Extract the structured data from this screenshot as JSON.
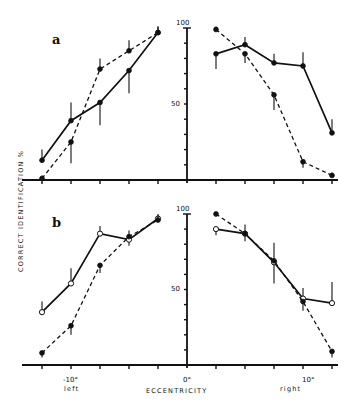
{
  "figure": {
    "y_axis_label": "CORRECT IDENTIFICATION %",
    "x_axis_label": "ECCENTRICITY",
    "x_tick_labels": {
      "left10": "-10°",
      "zero": "0°",
      "right10": "10°"
    },
    "side_labels": {
      "left": "left",
      "right": "right"
    },
    "y_tick_labels": {
      "top": "100",
      "mid": "50"
    },
    "panel_labels": [
      "a",
      "b"
    ]
  },
  "chart_data": [
    {
      "type": "line",
      "title": "a",
      "xlabel": "ECCENTRICITY",
      "ylabel": "CORRECT IDENTIFICATION %",
      "ylim": [
        0,
        100
      ],
      "x_left": [
        -12.5,
        -10,
        -7.5,
        -5,
        -2.5
      ],
      "x_right": [
        2.5,
        5,
        7.5,
        10,
        12.5
      ],
      "grid": false,
      "series": [
        {
          "name": "solid (filled circles)",
          "style": "solid",
          "marker": "filled",
          "left": [
            13,
            39,
            51,
            72,
            97
          ],
          "right": [
            83,
            89,
            77,
            75,
            31
          ],
          "err_left": [
            7,
            12,
            -15,
            -15,
            4
          ],
          "err_right": [
            -10,
            5,
            6,
            9,
            9
          ]
        },
        {
          "name": "dashed (filled circles)",
          "style": "dashed",
          "marker": "filled",
          "left": [
            1,
            25,
            73,
            85,
            97
          ],
          "right": [
            99,
            83,
            56,
            12,
            3
          ],
          "err_left": [
            2,
            -14,
            7,
            7,
            4
          ],
          "err_right": [
            2,
            -6,
            -10,
            -4,
            2
          ]
        }
      ]
    },
    {
      "type": "line",
      "title": "b",
      "xlabel": "ECCENTRICITY",
      "ylabel": "CORRECT IDENTIFICATION %",
      "ylim": [
        0,
        100
      ],
      "x_left": [
        -12.5,
        -10,
        -7.5,
        -5,
        -2.5
      ],
      "x_right": [
        2.5,
        5,
        7.5,
        10,
        12.5
      ],
      "grid": false,
      "series": [
        {
          "name": "solid (open circles)",
          "style": "solid",
          "marker": "open",
          "left": [
            35,
            54,
            87,
            83,
            97
          ],
          "right": [
            90,
            87,
            68,
            44,
            41
          ],
          "err_left": [
            7,
            10,
            5,
            -4,
            3
          ],
          "err_right": [
            -4,
            -5,
            -14,
            7,
            14
          ]
        },
        {
          "name": "dashed (filled circles)",
          "style": "dashed",
          "marker": "filled",
          "left": [
            8,
            26,
            66,
            85,
            96
          ],
          "right": [
            100,
            87,
            69,
            42,
            9
          ],
          "err_left": [
            -3,
            -6,
            -5,
            4,
            3
          ],
          "err_right": [
            0,
            6,
            12,
            -6,
            -4
          ]
        }
      ]
    }
  ]
}
